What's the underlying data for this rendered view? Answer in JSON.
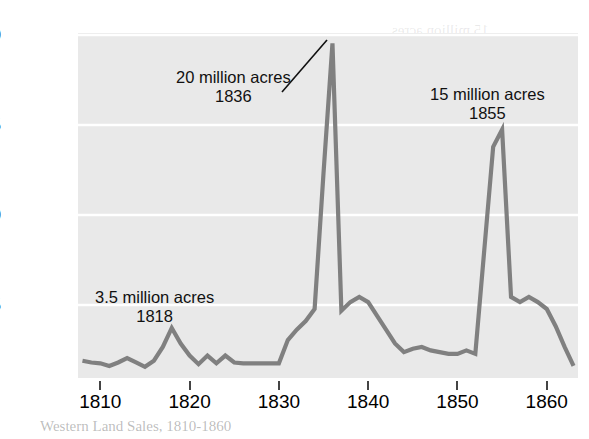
{
  "chart_data": {
    "type": "line",
    "title": "",
    "xlabel": "",
    "ylabel": "Acres (millions)",
    "xlim": [
      1807.5,
      1863.5
    ],
    "ylim": [
      0.6,
      20.6
    ],
    "xticks": [
      1810,
      1820,
      1830,
      1840,
      1850,
      1860
    ],
    "xtick_labels": [
      "1810",
      "1820",
      "1830",
      "1840",
      "1850",
      "1860"
    ],
    "yticks": [
      5,
      10,
      15,
      20
    ],
    "ytick_labels": [
      "5",
      "10",
      "15",
      "20"
    ],
    "grid": "horizontal-white-gridlines",
    "legend": "none",
    "line_color": "#808080",
    "plot_background": "#e9e9e9",
    "page_background": "#ffffff",
    "x": [
      1808,
      1809,
      1810,
      1811,
      1812,
      1813,
      1814,
      1815,
      1816,
      1817,
      1818,
      1819,
      1820,
      1821,
      1822,
      1823,
      1824,
      1825,
      1826,
      1827,
      1828,
      1829,
      1830,
      1831,
      1832,
      1833,
      1834,
      1835,
      1836,
      1837,
      1838,
      1839,
      1840,
      1841,
      1842,
      1843,
      1844,
      1845,
      1846,
      1847,
      1848,
      1849,
      1850,
      1851,
      1852,
      1853,
      1854,
      1855,
      1856,
      1857,
      1858,
      1859,
      1860,
      1861,
      1862,
      1863
    ],
    "y": [
      1.6,
      1.5,
      1.45,
      1.3,
      1.5,
      1.75,
      1.5,
      1.25,
      1.6,
      2.4,
      3.5,
      2.6,
      1.9,
      1.4,
      1.9,
      1.45,
      1.9,
      1.5,
      1.45,
      1.45,
      1.45,
      1.45,
      1.45,
      2.8,
      3.4,
      3.9,
      4.6,
      12.5,
      20.0,
      4.5,
      5.0,
      5.3,
      5.0,
      4.2,
      3.4,
      2.6,
      2.1,
      2.3,
      2.4,
      2.2,
      2.1,
      2.0,
      2.0,
      2.2,
      2.0,
      8.0,
      14.0,
      15.0,
      5.3,
      5.0,
      5.3,
      5.0,
      4.6,
      3.6,
      2.4,
      1.3
    ],
    "annotations": [
      {
        "label_line1": "20 million acres",
        "label_line2": "1836",
        "point_x": 1836,
        "point_y": 20.0,
        "leader": true
      },
      {
        "label_line1": "15 million acres",
        "label_line2": "1855",
        "point_x": 1855,
        "point_y": 15.0,
        "leader": false
      },
      {
        "label_line1": "3.5 million acres",
        "label_line2": "1818",
        "point_x": 1818,
        "point_y": 3.5,
        "leader": false
      }
    ]
  },
  "axes": {
    "y_title": "Acres (millions)",
    "y_labels": [
      "20",
      "15",
      "10",
      "5"
    ],
    "x_labels": [
      "1810",
      "1820",
      "1830",
      "1840",
      "1850",
      "1860"
    ]
  },
  "annotations": {
    "peak_1836": {
      "line1": "20 million acres",
      "line2": "1836"
    },
    "peak_1855": {
      "line1": "15 million acres",
      "line2": "1855"
    },
    "peak_1818": {
      "line1": "3.5 million acres",
      "line2": "1818"
    }
  },
  "bleed_through": {
    "caption": "Western Land Sales, 1810-1860",
    "fragments": [
      "15 million acres",
      "1855",
      "Acres (mill",
      "20 million",
      "Acres (millions)",
      "3.5 million acres"
    ]
  }
}
